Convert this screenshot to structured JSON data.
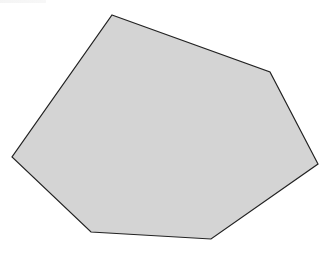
{
  "figure": {
    "shape": "polygon",
    "sides": 6,
    "fill": "#d4d4d4",
    "stroke": "#222222",
    "stroke_width": 1.2,
    "vertices": [
      [
        112,
        15
      ],
      [
        270,
        72
      ],
      [
        318,
        164
      ],
      [
        211,
        239
      ],
      [
        91,
        232
      ],
      [
        12,
        157
      ]
    ]
  }
}
